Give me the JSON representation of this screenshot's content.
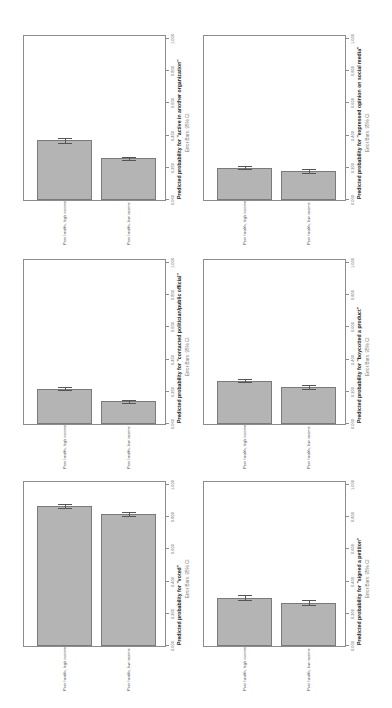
{
  "figure": {
    "layout": "2 rows x 3 panels, rendered rotated 90 degrees counter-clockwise",
    "category_labels": [
      "Poor health, high income",
      "Poor health, low income"
    ],
    "tick_labels": [
      "0.000",
      "0.200",
      "0.400",
      "0.600",
      "0.800",
      "1.000"
    ],
    "error_note": "Error Bars: 95% CI",
    "bar_color": "#b4b4b4"
  },
  "panels": [
    {
      "title": "Predicted probability for \"active in another organization\""
    },
    {
      "title": "Predicted probability for \"contacted politician/public official\""
    },
    {
      "title": "Predicted probability for \"voted\""
    },
    {
      "title": "Predicted probability for \"expressed opinion on social media\""
    },
    {
      "title": "Predicted probability for \"boycotted a product\""
    },
    {
      "title": "Predicted probability for \"signed a petition\""
    }
  ],
  "chart_data": [
    {
      "type": "bar",
      "orientation": "horizontal",
      "title": "Predicted probability for \"voted\"",
      "categories": [
        "Poor health, high income",
        "Poor health, low income"
      ],
      "values": [
        0.87,
        0.82
      ],
      "ci_low": [
        0.86,
        0.81
      ],
      "ci_high": [
        0.88,
        0.83
      ],
      "xlabel": "Predicted probability for \"voted\"",
      "note": "Error Bars: 95% CI",
      "xlim": [
        0,
        1
      ]
    },
    {
      "type": "bar",
      "orientation": "horizontal",
      "title": "Predicted probability for \"contacted politician/public official\"",
      "categories": [
        "Poor health, high income",
        "Poor health, low income"
      ],
      "values": [
        0.22,
        0.14
      ],
      "ci_low": [
        0.21,
        0.13
      ],
      "ci_high": [
        0.23,
        0.15
      ],
      "xlabel": "Predicted probability for \"contacted politician/public official\"",
      "note": "Error Bars: 95% CI",
      "xlim": [
        0,
        1
      ]
    },
    {
      "type": "bar",
      "orientation": "horizontal",
      "title": "Predicted probability for \"active in another organization\"",
      "categories": [
        "Poor health, high income",
        "Poor health, low income"
      ],
      "values": [
        0.37,
        0.26
      ],
      "ci_low": [
        0.355,
        0.25
      ],
      "ci_high": [
        0.385,
        0.27
      ],
      "xlabel": "Predicted probability for \"active in another organization\"",
      "note": "Error Bars: 95% CI",
      "xlim": [
        0,
        1
      ]
    },
    {
      "type": "bar",
      "orientation": "horizontal",
      "title": "Predicted probability for \"signed a petition\"",
      "categories": [
        "Poor health, high income",
        "Poor health, low income"
      ],
      "values": [
        0.3,
        0.27
      ],
      "ci_low": [
        0.285,
        0.255
      ],
      "ci_high": [
        0.315,
        0.285
      ],
      "xlabel": "Predicted probability for \"signed a petition\"",
      "note": "Error Bars: 95% CI",
      "xlim": [
        0,
        1
      ]
    },
    {
      "type": "bar",
      "orientation": "horizontal",
      "title": "Predicted probability for \"boycotted a product\"",
      "categories": [
        "Poor health, high income",
        "Poor health, low income"
      ],
      "values": [
        0.27,
        0.23
      ],
      "ci_low": [
        0.26,
        0.215
      ],
      "ci_high": [
        0.28,
        0.245
      ],
      "xlabel": "Predicted probability for \"boycotted a product\"",
      "note": "Error Bars: 95% CI",
      "xlim": [
        0,
        1
      ]
    },
    {
      "type": "bar",
      "orientation": "horizontal",
      "title": "Predicted probability for \"expressed opinion on social media\"",
      "categories": [
        "Poor health, high income",
        "Poor health, low income"
      ],
      "values": [
        0.2,
        0.18
      ],
      "ci_low": [
        0.19,
        0.17
      ],
      "ci_high": [
        0.21,
        0.19
      ],
      "xlabel": "Predicted probability for \"expressed opinion on social media\"",
      "note": "Error Bars: 95% CI",
      "xlim": [
        0,
        1
      ]
    }
  ]
}
